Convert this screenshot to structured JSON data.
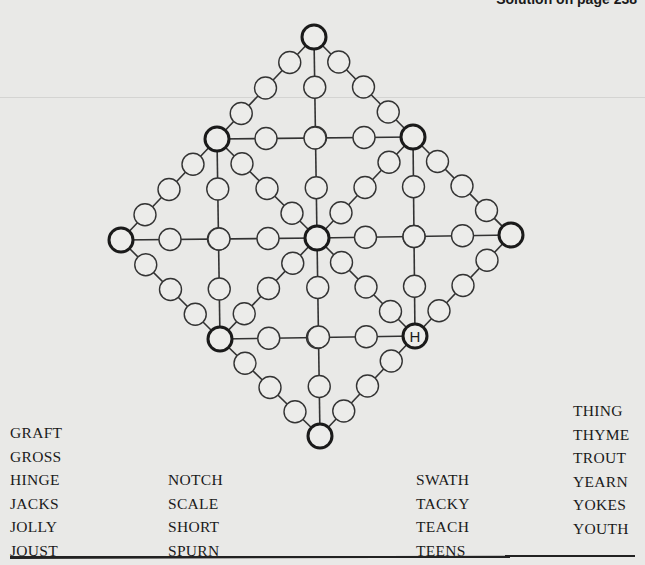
{
  "header": {
    "text": "Solution on page 238"
  },
  "puzzle": {
    "given_letters": [
      {
        "node": "H",
        "letter": "H"
      }
    ],
    "big_nodes": {
      "T": [
        314,
        37
      ],
      "UL": [
        217,
        139
      ],
      "UR": [
        413,
        137
      ],
      "L": [
        121,
        240
      ],
      "C": [
        317,
        238
      ],
      "R": [
        511,
        235
      ],
      "LL": [
        220,
        339
      ],
      "H": [
        415,
        336
      ],
      "B": [
        320,
        436
      ]
    },
    "edges": [
      [
        "T",
        "UL"
      ],
      [
        "T",
        "UR"
      ],
      [
        "T",
        "C"
      ],
      [
        "UL",
        "UR"
      ],
      [
        "UL",
        "C"
      ],
      [
        "UR",
        "C"
      ],
      [
        "L",
        "UL"
      ],
      [
        "UR",
        "R"
      ],
      [
        "UL",
        "LL"
      ],
      [
        "UR",
        "H"
      ],
      [
        "L",
        "C"
      ],
      [
        "C",
        "R"
      ],
      [
        "L",
        "LL"
      ],
      [
        "H",
        "R"
      ],
      [
        "LL",
        "C"
      ],
      [
        "C",
        "H"
      ],
      [
        "LL",
        "H"
      ],
      [
        "C",
        "B"
      ],
      [
        "LL",
        "B"
      ],
      [
        "H",
        "B"
      ]
    ],
    "small_per_edge": 3,
    "big_radius": 12,
    "small_radius": 11
  },
  "word_list": {
    "col1": [
      "GRAFT",
      "GROSS",
      "HINGE",
      "JACKS",
      "JOLLY",
      "JOUST"
    ],
    "col2": [
      "NOTCH",
      "SCALE",
      "SHORT",
      "SPURN"
    ],
    "col3": [
      "SWATH",
      "TACKY",
      "TEACH",
      "TEENS"
    ],
    "col4": [
      "THING",
      "THYME",
      "TROUT",
      "YEARN",
      "YOKES",
      "YOUTH"
    ]
  }
}
